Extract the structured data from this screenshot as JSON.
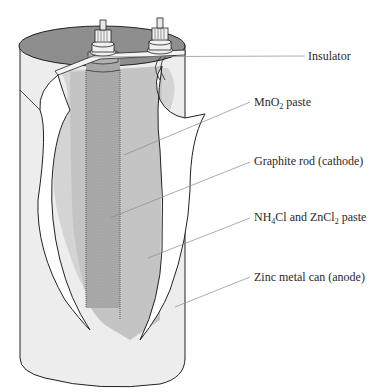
{
  "figure": {
    "colors": {
      "background": "#ffffff",
      "can_outer": "#ededed",
      "can_top": "#8e8e8e",
      "paste_outer": "#d4d4d4",
      "paste_inner": "#c4c4c4",
      "graphite_rod": "#a9a9a9",
      "insulator": "#f4f4f4",
      "cut_flap": "#ffffff",
      "outline": "#222222",
      "leader_line": "#8a8a8a",
      "label_text": "#2a2a2a"
    },
    "labels": [
      {
        "id": "insulator",
        "text": "Insulator",
        "pre": "Insulator",
        "sub": "",
        "post": "",
        "x": 308,
        "y": 59
      },
      {
        "id": "mno2",
        "text": "MnO2 paste",
        "pre": "MnO",
        "sub": "2",
        "post": " paste",
        "x": 254,
        "y": 106
      },
      {
        "id": "graphite",
        "text": "Graphite rod (cathode)",
        "pre": "Graphite rod (cathode)",
        "sub": "",
        "post": "",
        "x": 254,
        "y": 165
      },
      {
        "id": "paste",
        "text": "NH4Cl and ZnCl2 paste",
        "pre": "NH",
        "sub": "4",
        "mid": "Cl and ZnCl",
        "sub2": "2",
        "post": " paste",
        "x": 254,
        "y": 221
      },
      {
        "id": "zinc",
        "text": "Zinc metal can (anode)",
        "pre": "Zinc metal can (anode)",
        "sub": "",
        "post": "",
        "x": 254,
        "y": 281
      }
    ]
  }
}
